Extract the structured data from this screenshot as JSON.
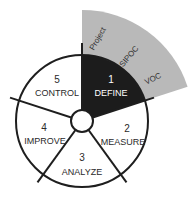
{
  "diagram": {
    "center": {
      "x": 82,
      "y": 121
    },
    "outer_radius": 66,
    "inner_radius": 11,
    "colors": {
      "outline": "#1e1e1e",
      "define_fill": "#1c1c1c",
      "band_fill": "#b9b9b9",
      "segment_fill": "#ffffff"
    },
    "phases": [
      {
        "number": "1",
        "name": "DEFINE",
        "highlighted": true
      },
      {
        "number": "2",
        "name": "MEASURE",
        "highlighted": false
      },
      {
        "number": "3",
        "name": "ANALYZE",
        "highlighted": false
      },
      {
        "number": "4",
        "name": "IMPROVE",
        "highlighted": false
      },
      {
        "number": "5",
        "name": "CONTROL",
        "highlighted": false
      }
    ],
    "define_tools": [
      {
        "label": "Project"
      },
      {
        "label": "SIPOC"
      },
      {
        "label": "VOC"
      }
    ]
  }
}
